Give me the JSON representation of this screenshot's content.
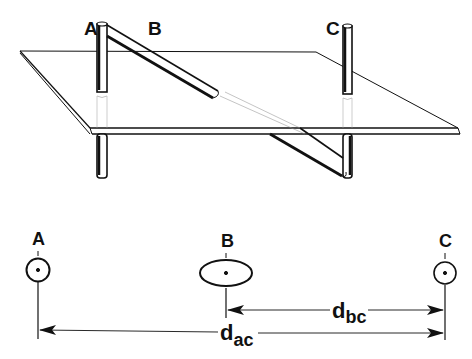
{
  "diagram": {
    "top_view": {
      "labels": {
        "a": "A",
        "b": "B",
        "c": "C"
      }
    },
    "bottom_view": {
      "labels": {
        "a": "A",
        "b": "B",
        "c": "C"
      },
      "dimensions": {
        "dbc": {
          "main": "d",
          "sub": "bc"
        },
        "dac": {
          "main": "d",
          "sub": "ac"
        }
      }
    },
    "colors": {
      "ink": "#111111",
      "paper": "#ffffff"
    }
  }
}
